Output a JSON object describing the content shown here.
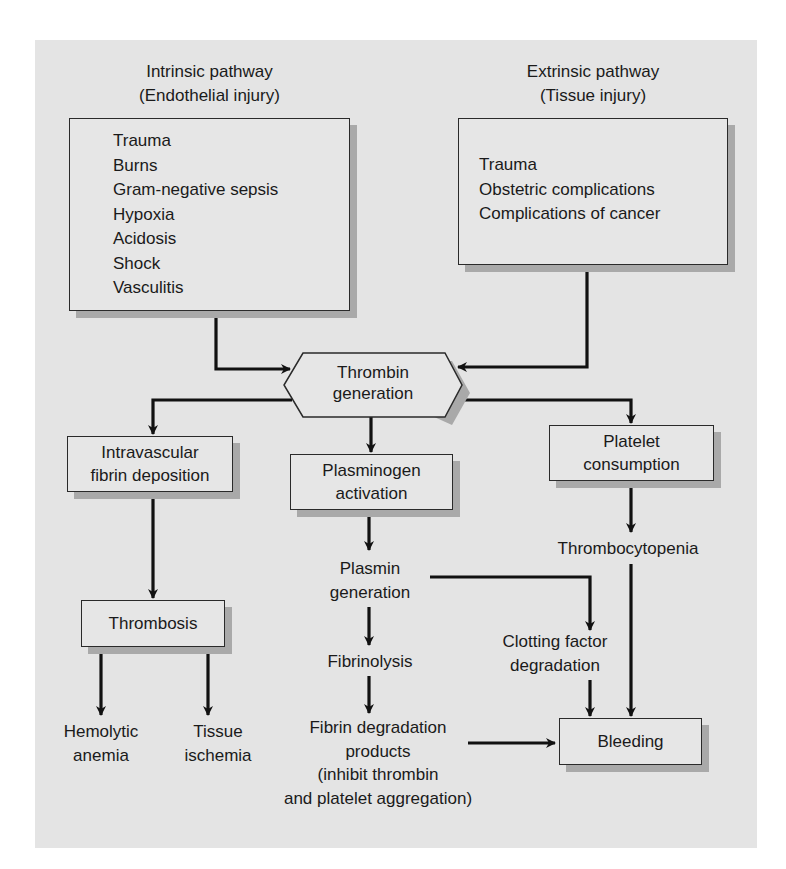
{
  "diagram": {
    "type": "flowchart",
    "colors": {
      "panel": "#e4e4e4",
      "box_fill": "#e6e6e6",
      "box_shadow": "#a9a9a9",
      "line": "#111111"
    },
    "intrinsic": {
      "heading_line1": "Intrinsic pathway",
      "heading_line2": "(Endothelial injury)",
      "causes": [
        "Trauma",
        "Burns",
        "Gram-negative sepsis",
        "Hypoxia",
        "Acidosis",
        "Shock",
        "Vasculitis"
      ]
    },
    "extrinsic": {
      "heading_line1": "Extrinsic pathway",
      "heading_line2": "(Tissue injury)",
      "causes": [
        "Trauma",
        "Obstetric complications",
        "Complications of cancer"
      ]
    },
    "thrombin": {
      "line1": "Thrombin",
      "line2": "generation"
    },
    "intravascular": {
      "line1": "Intravascular",
      "line2": "fibrin deposition"
    },
    "plasminogen": {
      "line1": "Plasminogen",
      "line2": "activation"
    },
    "platelet": {
      "line1": "Platelet",
      "line2": "consumption"
    },
    "thrombosis": {
      "label": "Thrombosis"
    },
    "hemolytic": {
      "line1": "Hemolytic",
      "line2": "anemia"
    },
    "ischemia": {
      "line1": "Tissue",
      "line2": "ischemia"
    },
    "plasmin": {
      "line1": "Plasmin",
      "line2": "generation"
    },
    "fibrinolysis": {
      "label": "Fibrinolysis"
    },
    "fdp": {
      "line1": "Fibrin degradation",
      "line2": "products",
      "line3": "(inhibit thrombin",
      "line4": "and platelet aggregation)"
    },
    "clotting": {
      "line1": "Clotting factor",
      "line2": "degradation"
    },
    "thrombocytopenia": {
      "label": "Thrombocytopenia"
    },
    "bleeding": {
      "label": "Bleeding"
    },
    "edges": [
      [
        "Intrinsic pathway",
        "Thrombin generation"
      ],
      [
        "Extrinsic pathway",
        "Thrombin generation"
      ],
      [
        "Thrombin generation",
        "Intravascular fibrin deposition"
      ],
      [
        "Thrombin generation",
        "Plasminogen activation"
      ],
      [
        "Thrombin generation",
        "Platelet consumption"
      ],
      [
        "Intravascular fibrin deposition",
        "Thrombosis"
      ],
      [
        "Thrombosis",
        "Hemolytic anemia"
      ],
      [
        "Thrombosis",
        "Tissue ischemia"
      ],
      [
        "Plasminogen activation",
        "Plasmin generation"
      ],
      [
        "Plasmin generation",
        "Fibrinolysis"
      ],
      [
        "Plasmin generation",
        "Clotting factor degradation"
      ],
      [
        "Fibrinolysis",
        "Fibrin degradation products"
      ],
      [
        "Fibrin degradation products",
        "Bleeding"
      ],
      [
        "Clotting factor degradation",
        "Bleeding"
      ],
      [
        "Platelet consumption",
        "Thrombocytopenia"
      ],
      [
        "Thrombocytopenia",
        "Bleeding"
      ]
    ]
  }
}
